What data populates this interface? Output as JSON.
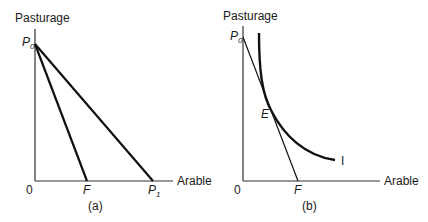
{
  "panel_a": {
    "y_axis_label": "Pasturage",
    "x_axis_label": "Arable",
    "origin": "0",
    "p0": "P",
    "p0_sub": "0",
    "f": "F",
    "p1": "P",
    "p1_sub": "1",
    "caption": "(a)"
  },
  "panel_b": {
    "y_axis_label": "Pasturage",
    "x_axis_label": "Arable",
    "origin": "0",
    "p0": "P",
    "p0_sub": "0",
    "e": "E",
    "f": "F",
    "curve": "I",
    "caption": "(b)"
  },
  "colors": {
    "line": "#111111",
    "text": "#1a1a1a",
    "background": "#ffffff"
  }
}
